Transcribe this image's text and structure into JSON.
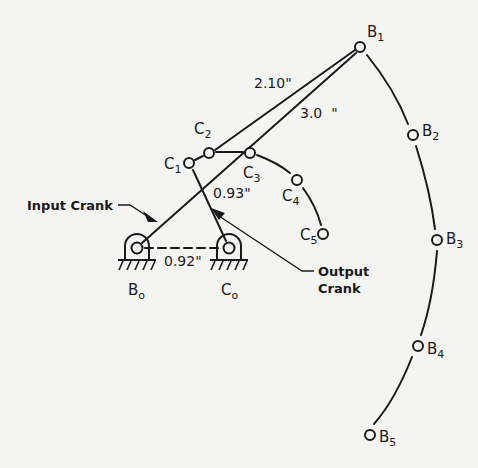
{
  "diagram": {
    "type": "four-bar linkage synthesis",
    "points": {
      "B": [
        {
          "label": "B",
          "sub": "1",
          "x": 360,
          "y": 47
        },
        {
          "label": "B",
          "sub": "2",
          "x": 413,
          "y": 135
        },
        {
          "label": "B",
          "sub": "3",
          "x": 437,
          "y": 240
        },
        {
          "label": "B",
          "sub": "4",
          "x": 418,
          "y": 346
        },
        {
          "label": "B",
          "sub": "5",
          "x": 370,
          "y": 435
        }
      ],
      "C": [
        {
          "label": "C",
          "sub": "1",
          "x": 189,
          "y": 163
        },
        {
          "label": "C",
          "sub": "2",
          "x": 209,
          "y": 153
        },
        {
          "label": "C",
          "sub": "3",
          "x": 250,
          "y": 153
        },
        {
          "label": "C",
          "sub": "4",
          "x": 297,
          "y": 180
        },
        {
          "label": "C",
          "sub": "5",
          "x": 323,
          "y": 234
        }
      ],
      "Bo": {
        "label": "B",
        "sub": "o",
        "x": 137,
        "y": 248
      },
      "Co": {
        "label": "C",
        "sub": "o",
        "x": 229,
        "y": 248
      }
    },
    "dimensions": {
      "coupler": "2.10\"",
      "input_link": "3.0  \"",
      "output_crank": "0.93\"",
      "ground": "0.92\""
    },
    "callouts": {
      "input_crank": "Input Crank",
      "output_crank_line1": "Output",
      "output_crank_line2": "Crank"
    },
    "labels": {
      "B1": "B",
      "B1_sub": "1",
      "B2": "B",
      "B2_sub": "2",
      "B3": "B",
      "B3_sub": "3",
      "B4": "B",
      "B4_sub": "4",
      "B5": "B",
      "B5_sub": "5",
      "C1": "C",
      "C1_sub": "1",
      "C2": "C",
      "C2_sub": "2",
      "C3": "C",
      "C3_sub": "3",
      "C4": "C",
      "C4_sub": "4",
      "C5": "C",
      "C5_sub": "5",
      "Bo": "B",
      "Bo_sub": "o",
      "Co": "C",
      "Co_sub": "o"
    }
  }
}
